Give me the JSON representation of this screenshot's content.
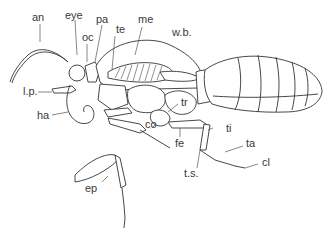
{
  "diagram": {
    "labels": {
      "an": "an",
      "eye": "eye",
      "pa": "pa",
      "me": "me",
      "oc": "oc",
      "te": "te",
      "wb": "w.b.",
      "lp": "l.p.",
      "ha": "ha",
      "tr": "tr",
      "co": "co",
      "ti": "ti",
      "fe": "fe",
      "ta": "ta",
      "ts": "t.s.",
      "cl": "cl",
      "ep": "ep"
    },
    "colors": {
      "line": "#333333",
      "text": "#3a3a3a",
      "background": "#ffffff"
    }
  }
}
